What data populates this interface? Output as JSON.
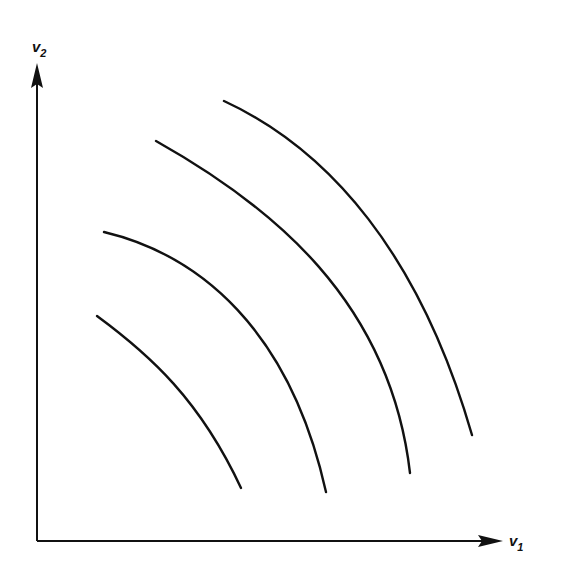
{
  "axes": {
    "y_label": "v",
    "y_label_sub": "2",
    "x_label": "v",
    "x_label_sub": "1",
    "origin": [
      37,
      541
    ],
    "y_arrow_tip": [
      37,
      63
    ],
    "x_arrow_tip": [
      500,
      541
    ],
    "color": "#111111"
  },
  "curves": [
    {
      "name": "curve-1",
      "d": "M97,316 C150,355 200,400 241,488"
    },
    {
      "name": "curve-2",
      "d": "M104,232 C200,255 290,330 326,492"
    },
    {
      "name": "curve-3",
      "d": "M156,141 C270,205 390,300 410,473"
    },
    {
      "name": "curve-4",
      "d": "M224,101 C330,150 420,255 472,435"
    }
  ]
}
